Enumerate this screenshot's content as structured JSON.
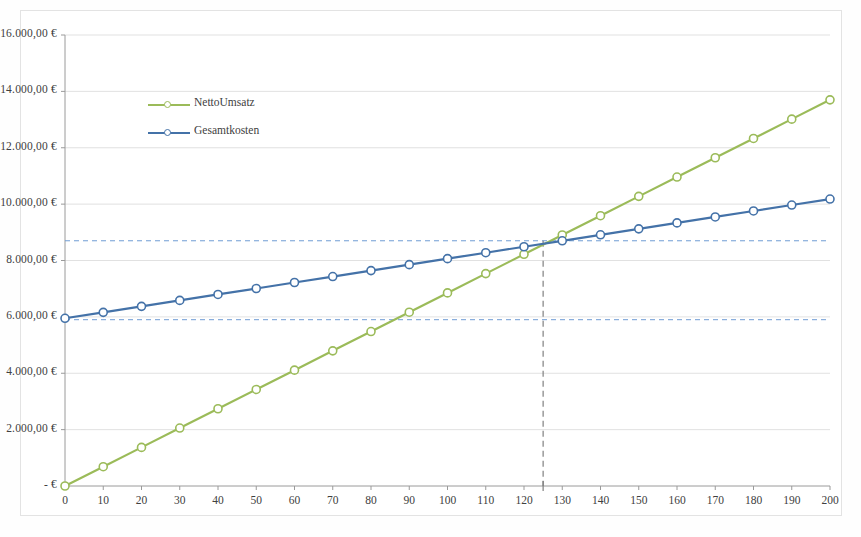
{
  "chart_data": {
    "type": "line",
    "title": "",
    "xlabel": "",
    "ylabel": "",
    "xlim": [
      0,
      200
    ],
    "ylim": [
      0,
      16000
    ],
    "grid": true,
    "legend_position": "inside-top-left",
    "x": [
      0,
      10,
      20,
      30,
      40,
      50,
      60,
      70,
      80,
      90,
      100,
      110,
      120,
      130,
      140,
      150,
      160,
      170,
      180,
      190,
      200
    ],
    "x_tick_labels": [
      "0",
      "10",
      "20",
      "30",
      "40",
      "50",
      "60",
      "70",
      "80",
      "90",
      "100",
      "110",
      "120",
      "130",
      "140",
      "150",
      "160",
      "170",
      "180",
      "190",
      "200"
    ],
    "y_tick_values": [
      0,
      2000,
      4000,
      6000,
      8000,
      10000,
      12000,
      14000,
      16000
    ],
    "y_tick_labels": [
      "-   €",
      "2.000,00 €",
      "4.000,00 €",
      "6.000,00 €",
      "8.000,00 €",
      "10.000,00 €",
      "12.000,00 €",
      "14.000,00 €",
      "16.000,00 €"
    ],
    "series": [
      {
        "name": "NettoUmsatz",
        "color": "#9BBB59",
        "marker": "circle-open",
        "values": [
          0,
          685,
          1370,
          2055,
          2740,
          3425,
          4110,
          4795,
          5480,
          6165,
          6850,
          7535,
          8220,
          8905,
          9590,
          10275,
          10960,
          11645,
          12330,
          13015,
          13700
        ]
      },
      {
        "name": "Gesamtkosten",
        "color": "#4472A8",
        "marker": "circle-open",
        "values": [
          5950,
          6161,
          6373,
          6584,
          6796,
          7007,
          7219,
          7430,
          7642,
          7853,
          8065,
          8276,
          8488,
          8699,
          8911,
          9122,
          9334,
          9545,
          9757,
          9968,
          10180
        ]
      }
    ],
    "annotations": {
      "breakeven_x": 125,
      "breakeven_y": 8700,
      "vertical_guide": {
        "x": 125,
        "color": "#808080",
        "style": "dashed"
      },
      "upper_horizontal_guide": {
        "y": 8700,
        "color": "#6F9CD4",
        "style": "dashed"
      },
      "lower_horizontal_guide": {
        "y": 5900,
        "color": "#6F9CD4",
        "style": "dashed"
      }
    }
  },
  "legend": {
    "items": [
      {
        "label": "NettoUmsatz",
        "color": "#9BBB59"
      },
      {
        "label": "Gesamtkosten",
        "color": "#4472A8"
      }
    ]
  }
}
